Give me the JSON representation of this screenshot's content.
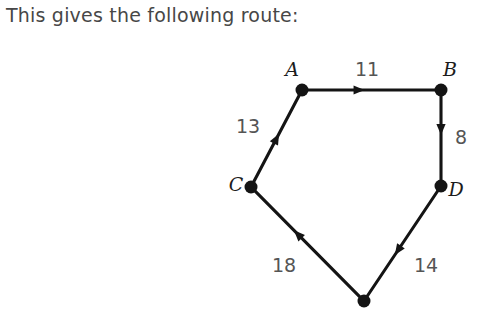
{
  "caption": {
    "text": "This gives the following route:"
  },
  "colors": {
    "background": "#ffffff",
    "caption_text": "#474747",
    "edge": "#141414",
    "node": "#141414",
    "node_label": "#1c1c1c",
    "edge_label": "#555555"
  },
  "diagram": {
    "type": "directed-graph-cycle",
    "nodes": [
      {
        "id": "A",
        "label": "A",
        "x": 302,
        "y": 90,
        "label_x": 292,
        "label_y": 76,
        "labelled": true
      },
      {
        "id": "B",
        "label": "B",
        "x": 441,
        "y": 90,
        "label_x": 450,
        "label_y": 76,
        "labelled": true
      },
      {
        "id": "C",
        "label": "C",
        "x": 251,
        "y": 187,
        "label_x": 236,
        "label_y": 191,
        "labelled": true
      },
      {
        "id": "D",
        "label": "D",
        "x": 441,
        "y": 186,
        "label_x": 456,
        "label_y": 196,
        "labelled": true
      },
      {
        "id": "E",
        "label": "",
        "x": 364,
        "y": 301,
        "label_x": 364,
        "label_y": 301,
        "labelled": false
      }
    ],
    "edges": [
      {
        "id": "C-A",
        "from": "C",
        "to": "A",
        "weight": "13",
        "label_x": 248,
        "label_y": 133,
        "arrow_t": 0.55
      },
      {
        "id": "A-B",
        "from": "A",
        "to": "B",
        "weight": "11",
        "label_x": 367,
        "label_y": 76,
        "arrow_t": 0.45
      },
      {
        "id": "B-D",
        "from": "B",
        "to": "D",
        "weight": "8",
        "label_x": 461,
        "label_y": 144,
        "arrow_t": 0.47
      },
      {
        "id": "D-E",
        "from": "D",
        "to": "E",
        "weight": "14",
        "label_x": 426,
        "label_y": 272,
        "arrow_t": 0.6
      },
      {
        "id": "E-C",
        "from": "E",
        "to": "C",
        "weight": "18",
        "label_x": 284,
        "label_y": 272,
        "arrow_t": 0.62
      }
    ],
    "node_radius": 6.5,
    "arrow_size": 11
  }
}
